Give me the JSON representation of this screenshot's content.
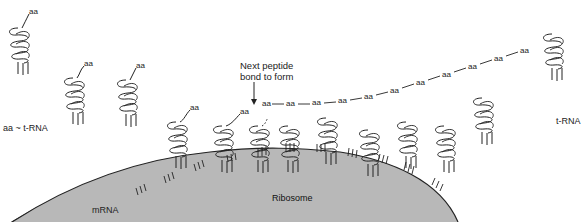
{
  "diagram": {
    "type": "protein synthesis on ribosome",
    "labels": {
      "aa_trna": "aa ~ t-RNA",
      "trna": "t-RNA",
      "mrna": "mRNA",
      "ribosome": "Ribosome",
      "next_bond_line1": "Next peptide",
      "next_bond_line2": "bond to form"
    },
    "amino_acid": "aa",
    "peptide_chain": [
      "aa",
      "aa",
      "aa",
      "aa",
      "aa",
      "aa",
      "aa",
      "aa",
      "aa",
      "aa",
      "aa"
    ],
    "colors": {
      "ribosome_fill": "#b8b8b8",
      "ink": "#222222",
      "background": "#ffffff"
    }
  }
}
